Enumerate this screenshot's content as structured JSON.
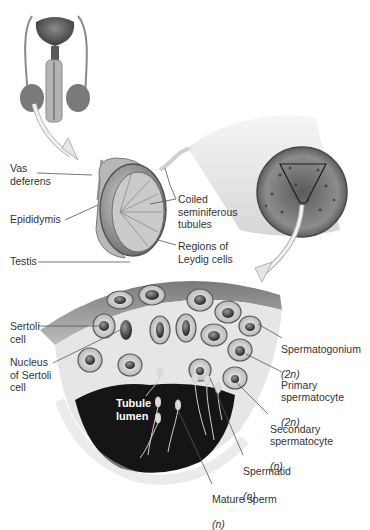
{
  "figure": {
    "type": "anatomical-diagram",
    "colors": {
      "background": "#ffffff",
      "tissue_light": "#d8d8d8",
      "tissue_mid": "#9a9a9a",
      "tissue_dark": "#4a4a4a",
      "lumen": "#151515",
      "leader_line": "#555555",
      "text": "#333333"
    }
  },
  "labels": {
    "vas_deferens": "Vas\ndeferens",
    "epididymis": "Epididymis",
    "testis": "Testis",
    "coiled_tubules": "Coiled\nseminiferous\ntubules",
    "leydig": "Regions of\nLeydig cells",
    "sertoli_cell": "Sertoli\ncell",
    "sertoli_nucleus": "Nucleus\nof Sertoli\ncell",
    "tubule_lumen": "Tubule\nlumen",
    "spermatogonium": "Spermatogonium",
    "spermatogonium_ploidy": "(2n)",
    "primary": "Primary\nspermatocyte",
    "primary_ploidy": "(2n)",
    "secondary": "Secondary\nspermatocyte",
    "secondary_ploidy": "(n)",
    "spermatid": "Spermatid",
    "spermatid_ploidy": "(n)",
    "mature_sperm": "Mature sperm",
    "mature_sperm_ploidy": "(n)"
  }
}
